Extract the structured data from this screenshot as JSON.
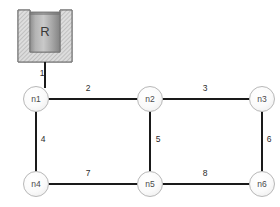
{
  "diagram": {
    "background_color": "#ffffff",
    "line_color": "#1a1a1a",
    "node_fill_color": "#f5f5f5",
    "node_stroke_color": "#b8b8b8",
    "label_color": "#2b2b2b"
  },
  "reservoir": {
    "label": "R",
    "name": "reservoir-tank",
    "wall_color": "#d9d9d9",
    "fluid_color": "#a8a8a8"
  },
  "nodes": [
    {
      "id": "n1",
      "label": "n1",
      "x": 36,
      "y": 99
    },
    {
      "id": "n2",
      "label": "n2",
      "x": 150,
      "y": 99
    },
    {
      "id": "n3",
      "label": "n3",
      "x": 262,
      "y": 99
    },
    {
      "id": "n4",
      "label": "n4",
      "x": 36,
      "y": 184
    },
    {
      "id": "n5",
      "label": "n5",
      "x": 150,
      "y": 184
    },
    {
      "id": "n6",
      "label": "n6",
      "x": 262,
      "y": 184
    }
  ],
  "edges": [
    {
      "id": "p1",
      "label": "1",
      "from": "R",
      "to": "n1",
      "orientation": "vertical",
      "label_x": 42,
      "label_y": 74
    },
    {
      "id": "p2",
      "label": "2",
      "from": "n1",
      "to": "n2",
      "orientation": "horizontal",
      "label_x": 88,
      "label_y": 89
    },
    {
      "id": "p3",
      "label": "3",
      "from": "n2",
      "to": "n3",
      "orientation": "horizontal",
      "label_x": 205,
      "label_y": 89
    },
    {
      "id": "p4",
      "label": "4",
      "from": "n1",
      "to": "n4",
      "orientation": "vertical",
      "label_x": 43,
      "label_y": 140
    },
    {
      "id": "p5",
      "label": "5",
      "from": "n2",
      "to": "n5",
      "orientation": "vertical",
      "label_x": 158,
      "label_y": 140
    },
    {
      "id": "p6",
      "label": "6",
      "from": "n3",
      "to": "n6",
      "orientation": "vertical",
      "label_x": 269,
      "label_y": 140
    },
    {
      "id": "p7",
      "label": "7",
      "from": "n4",
      "to": "n5",
      "orientation": "horizontal",
      "label_x": 88,
      "label_y": 174
    },
    {
      "id": "p8",
      "label": "8",
      "from": "n5",
      "to": "n6",
      "orientation": "horizontal",
      "label_x": 205,
      "label_y": 174
    }
  ]
}
